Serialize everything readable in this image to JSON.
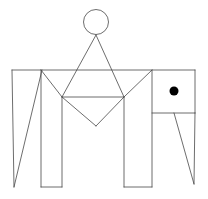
{
  "figure": {
    "width": 208,
    "height": 199,
    "background_color": "#ffffff",
    "stroke_color": "#474747",
    "stroke_width": 0.8,
    "circles": [
      {
        "name": "head-circle",
        "cx": 96,
        "cy": 22,
        "r": 12.5,
        "fill": "none"
      },
      {
        "name": "eye-dot",
        "cx": 174,
        "cy": 91,
        "r": 4.5,
        "fill": "#000000"
      }
    ],
    "lines": [
      {
        "name": "body-top-edge",
        "x1": 12,
        "y1": 70,
        "x2": 195,
        "y2": 70
      },
      {
        "name": "left-triangle-left-edge",
        "x1": 12,
        "y1": 70,
        "x2": 14,
        "y2": 187
      },
      {
        "name": "left-triangle-hypotenuse",
        "x1": 42,
        "y1": 70,
        "x2": 14,
        "y2": 187
      },
      {
        "name": "left-leg-left-edge",
        "x1": 41,
        "y1": 70,
        "x2": 41,
        "y2": 187
      },
      {
        "name": "left-leg-bottom-edge",
        "x1": 41,
        "y1": 187,
        "x2": 62,
        "y2": 187
      },
      {
        "name": "left-leg-right-edge",
        "x1": 62,
        "y1": 97,
        "x2": 62,
        "y2": 187
      },
      {
        "name": "left-leg-top-diagonal",
        "x1": 41,
        "y1": 70,
        "x2": 62,
        "y2": 97
      },
      {
        "name": "body-mid-horizontal",
        "x1": 62,
        "y1": 97,
        "x2": 124,
        "y2": 97
      },
      {
        "name": "circle-triangle-left-edge",
        "x1": 96,
        "y1": 35,
        "x2": 62,
        "y2": 97
      },
      {
        "name": "circle-triangle-right-edge",
        "x1": 96,
        "y1": 35,
        "x2": 124,
        "y2": 97
      },
      {
        "name": "diamond-left-edge",
        "x1": 62,
        "y1": 97,
        "x2": 96,
        "y2": 126
      },
      {
        "name": "diamond-right-edge",
        "x1": 124,
        "y1": 97,
        "x2": 96,
        "y2": 126
      },
      {
        "name": "right-leg-top-diagonal",
        "x1": 124,
        "y1": 97,
        "x2": 152,
        "y2": 70
      },
      {
        "name": "right-leg-left-edge",
        "x1": 124,
        "y1": 97,
        "x2": 124,
        "y2": 187
      },
      {
        "name": "right-leg-bottom-edge",
        "x1": 124,
        "y1": 187,
        "x2": 152,
        "y2": 187
      },
      {
        "name": "head-left-edge",
        "x1": 152,
        "y1": 70,
        "x2": 152,
        "y2": 187
      },
      {
        "name": "head-bottom-edge",
        "x1": 152,
        "y1": 113,
        "x2": 195,
        "y2": 113
      },
      {
        "name": "head-right-edge",
        "x1": 195,
        "y1": 70,
        "x2": 195,
        "y2": 113
      },
      {
        "name": "trunk-diagonal",
        "x1": 174,
        "y1": 113,
        "x2": 194,
        "y2": 184
      },
      {
        "name": "trunk-right-edge",
        "x1": 195,
        "y1": 113,
        "x2": 194,
        "y2": 184
      }
    ]
  }
}
